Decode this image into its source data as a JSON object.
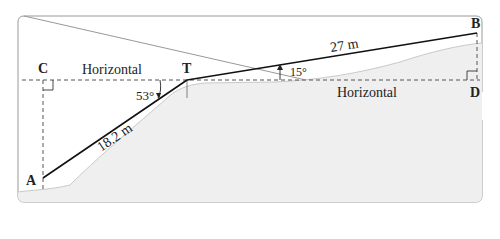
{
  "figure": {
    "points": {
      "A": "A",
      "B": "B",
      "C": "C",
      "D": "D",
      "T": "T"
    },
    "labels": {
      "horizontal_left": "Horizontal",
      "horizontal_right": "Horizontal",
      "length_AT": "18.2 m",
      "length_TB": "27 m",
      "angle_CTA": "53°",
      "angle_BT": "15°"
    },
    "colors": {
      "ground": "#efefef",
      "ground_edge": "#c8c8c8",
      "line": "#111111",
      "dashed": "#555555",
      "frame": "#888888"
    }
  }
}
